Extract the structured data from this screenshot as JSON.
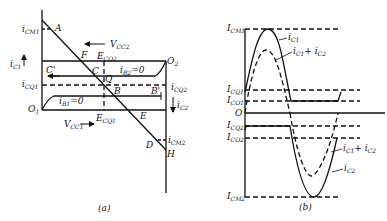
{
  "figure": {
    "panel_a": {
      "caption": "(a)",
      "points": {
        "A": "A",
        "F": "F",
        "C": "C",
        "C_prime": "C'",
        "Q": "Q",
        "B": "B",
        "B_prime": "B'",
        "E": "E",
        "D": "D",
        "H": "H",
        "O1": "O",
        "O1_sub": "1",
        "O2": "O",
        "O2_sub": "2"
      },
      "labels": {
        "icm1": "i",
        "icm1_sub": "CM1",
        "ic1": "i",
        "ic1_sub": "C1",
        "icq1": "i",
        "icq1_sub": "CQ1",
        "vcc2": "V",
        "vcc2_sub": "CC2",
        "ecq2": "E",
        "ecq2_sub": "CQ2",
        "ib2": "i",
        "ib2_sub": "B2",
        "ib2_eq": "=0",
        "ib1": "i",
        "ib1_sub": "B1",
        "ib1_eq": "=0",
        "icq2": "i",
        "icq2_sub": "CQ2",
        "ic2": "i",
        "ic2_sub": "C2",
        "vcc1": "V",
        "vcc1_sub": "CC1",
        "ecq1": "E",
        "ecq1_sub": "CQ1",
        "icm2": "i",
        "icm2_sub": "CM2"
      }
    },
    "panel_b": {
      "caption": "(b)",
      "axis_labels": {
        "icm1": "I",
        "icm1_sub": "CM1",
        "icq1": "I",
        "icq1_sub": "CQ1",
        "ico1": "I",
        "ico1_sub": "CO1",
        "zero": "O",
        "icq2": "I",
        "icq2_sub": "CQ2",
        "ico2": "I",
        "ico2_sub": "CO2",
        "icm2": "I",
        "icm2_sub": "CM2"
      },
      "curve_labels": {
        "ic1": "i",
        "ic1_sub": "C1",
        "sum": "i",
        "sum_sub1": "C1",
        "sum_plus": "+ i",
        "sum_sub2": "C2",
        "sum2": "i",
        "sum2_sub1": "C1",
        "sum2_plus": "+ i",
        "sum2_sub2": "C2",
        "ic2": "i",
        "ic2_sub": "C2"
      }
    }
  }
}
